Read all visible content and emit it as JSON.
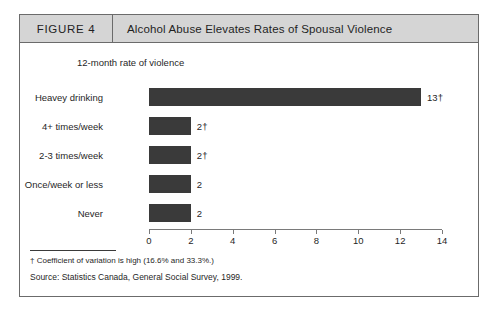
{
  "figure": {
    "number_label": "FIGURE 4",
    "title": "Alcohol Abuse Elevates Rates of Spousal Violence"
  },
  "footer": {
    "footnote": "† Coefficient of variation is high (16.6% and 33.3%.)",
    "source": "Source:  Statistics Canada, General Social Survey, 1999."
  },
  "colors": {
    "bar_fill": "#3a3a3a",
    "header_band": "#d5d5d5",
    "border": "#6b6b6b",
    "axis": "#7a7a7a"
  },
  "chart_data": {
    "type": "bar",
    "orientation": "horizontal",
    "title": "Alcohol Abuse Elevates Rates of Spousal Violence",
    "subtitle": "12-month rate of violence",
    "xlabel": "",
    "ylabel": "",
    "xlim": [
      0,
      14
    ],
    "xticks": [
      0,
      2,
      4,
      6,
      8,
      10,
      12,
      14
    ],
    "xtick_labels": [
      "0",
      "2",
      "4",
      "6",
      "8",
      "10",
      "12",
      "14"
    ],
    "grid": false,
    "legend": false,
    "categories": [
      "Heavey drinking",
      "4+ times/week",
      "2-3 times/week",
      "Once/week or less",
      "Never"
    ],
    "values": [
      13,
      2,
      2,
      2,
      2
    ],
    "value_labels": [
      "13†",
      "2†",
      "2†",
      "2",
      "2"
    ]
  }
}
